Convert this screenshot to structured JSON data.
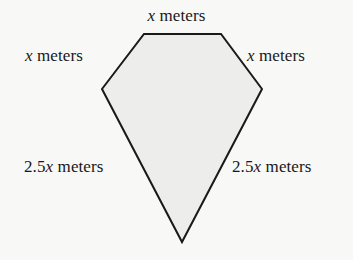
{
  "figure": {
    "shape_name": "pentagon",
    "fill_color": "#ededeb",
    "stroke_color": "#1a1a1a",
    "background_color": "#f8f8f6",
    "stroke_width": 2,
    "vertices": [
      {
        "name": "top-left",
        "x": 144,
        "y": 34
      },
      {
        "name": "top-right",
        "x": 221,
        "y": 34
      },
      {
        "name": "right",
        "x": 262,
        "y": 89
      },
      {
        "name": "bottom-apex",
        "x": 182,
        "y": 242
      },
      {
        "name": "left",
        "x": 102,
        "y": 89
      }
    ],
    "labels": {
      "top": {
        "value": "x",
        "unit": "meters"
      },
      "upper_left": {
        "value": "x",
        "unit": "meters"
      },
      "upper_right": {
        "value": "x",
        "unit": "meters"
      },
      "lower_left": {
        "value": "2.5x",
        "coefficient": "2.5",
        "variable": "x",
        "unit": "meters"
      },
      "lower_right": {
        "value": "2.5x",
        "coefficient": "2.5",
        "variable": "x",
        "unit": "meters"
      }
    }
  }
}
